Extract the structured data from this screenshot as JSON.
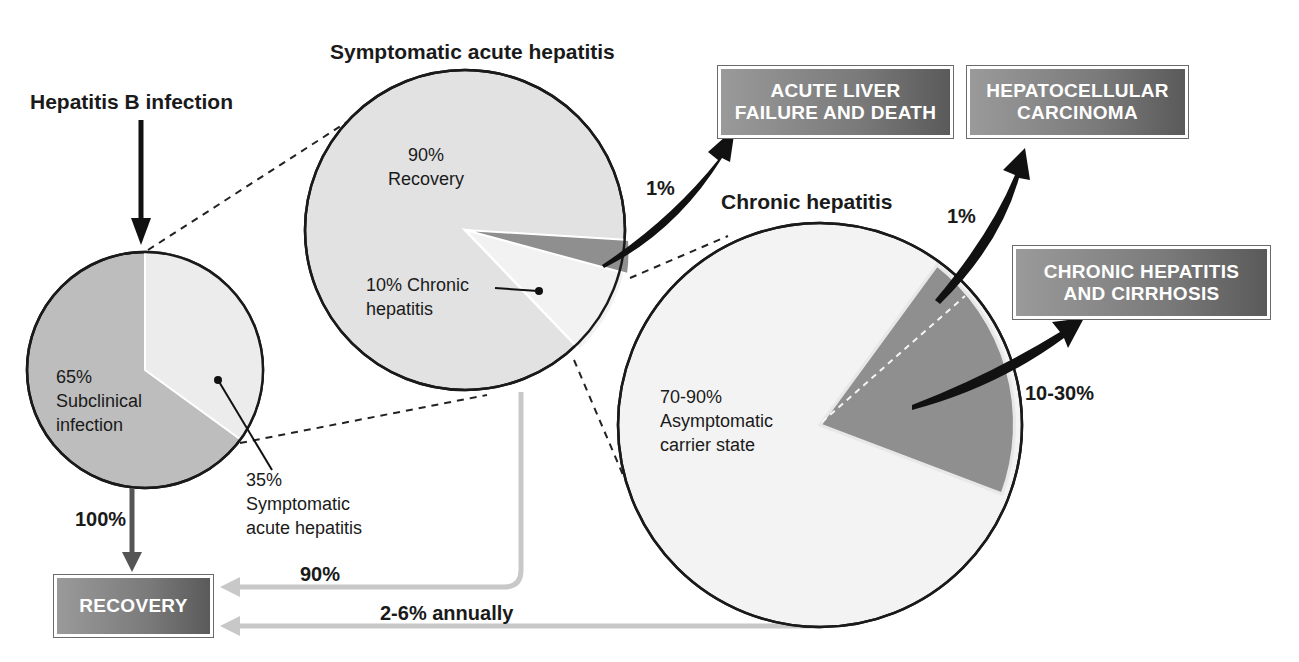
{
  "titles": {
    "infection": "Hepatitis B infection",
    "symptomatic": "Symptomatic acute hepatitis",
    "chronic": "Chronic hepatitis"
  },
  "pies": {
    "infection": {
      "slices": [
        {
          "pct": "65%",
          "label": "Subclinical",
          "label2": "infection",
          "value": 65
        },
        {
          "pct": "35%",
          "label": "Symptomatic",
          "label2": "acute hepatitis",
          "value": 35
        }
      ]
    },
    "symptomatic": {
      "slices": [
        {
          "pct": "90%",
          "label": "Recovery",
          "value": 90
        },
        {
          "pct": "10% Chronic",
          "label": "hepatitis",
          "value": 10
        },
        {
          "pct": "1%",
          "label": "to acute liver failure",
          "value": 1
        }
      ]
    },
    "chronic": {
      "slices": [
        {
          "pct": "70-90%",
          "label": "Asymptomatic",
          "label2": "carrier state",
          "value": 80
        },
        {
          "pct": "10-30%",
          "label": "to chronic hepatitis and cirrhosis",
          "value": 20
        },
        {
          "pct": "1%",
          "label": "to hepatocellular carcinoma",
          "value": 1
        }
      ]
    }
  },
  "flows": {
    "to_recovery_100": "100%",
    "to_recovery_90": "90%",
    "to_recovery_annual": "2-6% annually",
    "to_liver_failure": "1%",
    "to_hcc": "1%",
    "to_cirrhosis": "10-30%"
  },
  "outcomes": {
    "recovery": "RECOVERY",
    "liver_failure_1": "ACUTE LIVER",
    "liver_failure_2": "FAILURE AND DEATH",
    "hcc_1": "HEPATOCELLULAR",
    "hcc_2": "CARCINOMA",
    "cirrhosis_1": "CHRONIC HEPATITIS",
    "cirrhosis_2": "AND CIRRHOSIS"
  },
  "colors": {
    "dark_slice": "#bdbdbd",
    "light_slice": "#ececec",
    "accent_slice": "#8f8f8f",
    "box_dark": "#5a5a5a",
    "box_light": "#9a9a9a",
    "flow_gray": "#c8c8c8"
  }
}
